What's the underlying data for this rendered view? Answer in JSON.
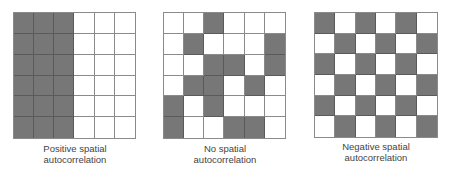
{
  "figure": {
    "colors": {
      "filled": "#777777",
      "empty": "#ffffff",
      "gridline": "#8a8a8a"
    },
    "panels": [
      {
        "id": "positive",
        "caption_line1": "Positive spatial",
        "caption_line2": "autocorrelation",
        "grid": [
          [
            1,
            1,
            1,
            0,
            0,
            0
          ],
          [
            1,
            1,
            1,
            0,
            0,
            0
          ],
          [
            1,
            1,
            1,
            0,
            0,
            0
          ],
          [
            1,
            1,
            1,
            0,
            0,
            0
          ],
          [
            1,
            1,
            1,
            0,
            0,
            0
          ],
          [
            1,
            1,
            1,
            0,
            0,
            0
          ]
        ]
      },
      {
        "id": "none",
        "caption_line1": "No spatial",
        "caption_line2": "autocorrelation",
        "grid": [
          [
            0,
            0,
            1,
            0,
            0,
            0
          ],
          [
            0,
            1,
            0,
            0,
            0,
            1
          ],
          [
            0,
            0,
            1,
            1,
            0,
            1
          ],
          [
            0,
            1,
            1,
            0,
            1,
            0
          ],
          [
            1,
            0,
            1,
            0,
            0,
            0
          ],
          [
            1,
            0,
            0,
            1,
            1,
            0
          ]
        ]
      },
      {
        "id": "negative",
        "caption_line1": "Negative spatial",
        "caption_line2": "autocorrelation",
        "grid": [
          [
            1,
            0,
            1,
            0,
            1,
            0
          ],
          [
            0,
            1,
            0,
            1,
            0,
            1
          ],
          [
            1,
            0,
            1,
            0,
            1,
            0
          ],
          [
            0,
            1,
            0,
            1,
            0,
            1
          ],
          [
            1,
            0,
            1,
            0,
            1,
            0
          ],
          [
            0,
            1,
            0,
            1,
            0,
            1
          ]
        ]
      }
    ]
  }
}
